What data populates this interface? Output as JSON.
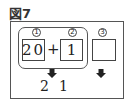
{
  "figure": {
    "label": "図7"
  },
  "slots": [
    {
      "marker": "1",
      "value": "20"
    },
    {
      "marker": "2",
      "value": "1"
    },
    {
      "marker": "3",
      "value": ""
    }
  ],
  "operator": "+",
  "result": {
    "digits": [
      "2",
      "1"
    ]
  },
  "icons": {
    "arrow": "down-arrow-icon"
  }
}
